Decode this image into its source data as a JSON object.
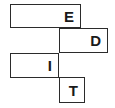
{
  "diagram": {
    "type": "offset-rectangle-blocks",
    "background_color": "#ffffff",
    "stroke_color": "#2b2b2b",
    "text_color": "#1a1a1a",
    "fill_color": "#ffffff",
    "word": "EDIT",
    "blocks": [
      {
        "id": "e",
        "label": "E",
        "name": "block-e",
        "x": 10,
        "y": 4,
        "width": 71,
        "height": 24,
        "align": "right"
      },
      {
        "id": "d",
        "label": "D",
        "name": "block-d",
        "x": 59,
        "y": 28,
        "width": 49,
        "height": 25,
        "align": "right"
      },
      {
        "id": "i",
        "label": "I",
        "name": "block-i",
        "x": 10,
        "y": 53,
        "width": 49,
        "height": 25,
        "align": "right"
      },
      {
        "id": "t",
        "label": "T",
        "name": "block-t",
        "x": 59,
        "y": 77,
        "width": 26,
        "height": 26,
        "align": "right"
      }
    ]
  }
}
